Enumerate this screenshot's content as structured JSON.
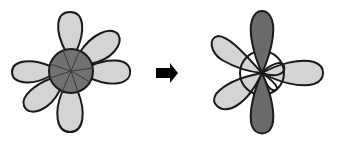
{
  "diagram": {
    "colors": {
      "light_lobe": "#d4d4d4",
      "dark_lobe": "#6a6a6a",
      "center_dark": "#727272",
      "outline": "#1a1a1a",
      "arrow": "#000000",
      "background": "#ffffff"
    },
    "left_figure": {
      "label": "before",
      "petal_count": 6,
      "center_fill": "dark"
    },
    "arrow": {
      "icon": "right-arrow-icon"
    },
    "right_figure": {
      "label": "after",
      "dark_lobes": 2,
      "light_lobes": 3,
      "center_fill": "light"
    }
  }
}
